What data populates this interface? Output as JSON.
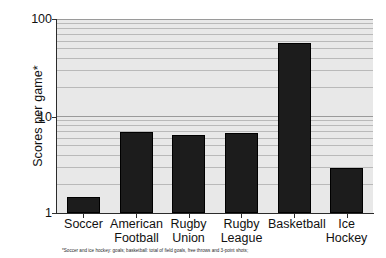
{
  "chart_data": {
    "type": "bar",
    "title": "",
    "xlabel": "",
    "ylabel": "Scores per game*",
    "categories": [
      "Soccer",
      "American Football",
      "Rugby Union",
      "Rugby League",
      "Basketball",
      "Ice Hockey"
    ],
    "category_lines": [
      [
        "Soccer"
      ],
      [
        "American",
        "Football"
      ],
      [
        "Rugby",
        "Union"
      ],
      [
        "Rugby",
        "League"
      ],
      [
        "Basketball"
      ],
      [
        "Ice",
        "Hockey"
      ]
    ],
    "values": [
      1.45,
      6.8,
      6.3,
      6.7,
      57,
      2.9
    ],
    "yscale": "log",
    "ylim": [
      1,
      100
    ],
    "ytick_labels": [
      "100",
      "10",
      "1"
    ],
    "ytick_values": [
      100,
      10,
      1
    ],
    "grid": true,
    "grid_orientation": "horizontal",
    "legend": "none",
    "footnote": "*Soccer and ice hockey: goals; basketball: total of field goals, free throws and 3-point shots;",
    "colors": {
      "bar": "#1c1c1c",
      "plot_background": "#e8e8e8",
      "gridline": "#b9b9b9",
      "axis": "#2b2b2b",
      "text": "#111111",
      "page_background": "#ffffff"
    }
  }
}
